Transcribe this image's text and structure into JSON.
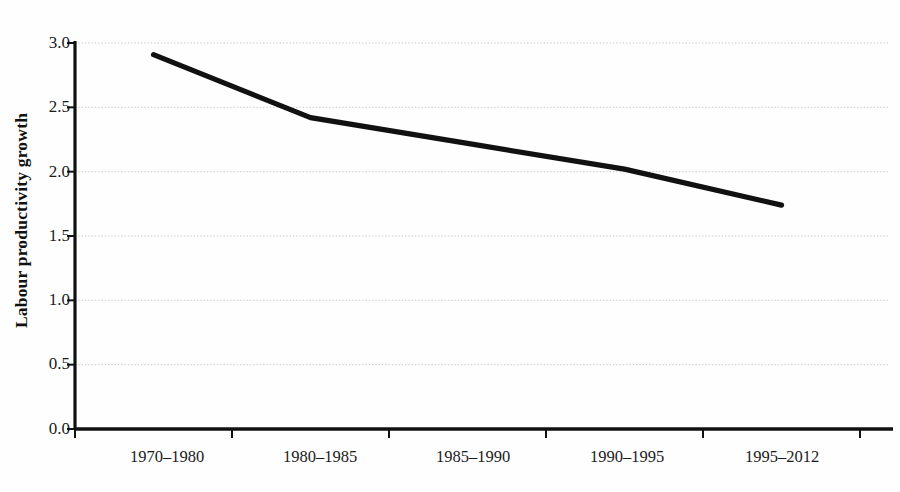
{
  "chart_data": {
    "type": "line",
    "title": "",
    "subtitle": "",
    "xlabel": "",
    "ylabel": "Labour productivity growth",
    "categories": [
      "1970–1980",
      "1980–1985",
      "1985–1990",
      "1990–1995",
      "1995–2012"
    ],
    "values": [
      2.91,
      2.42,
      2.22,
      2.02,
      1.74
    ],
    "series": [
      {
        "name": "Labour productivity growth",
        "values": [
          2.91,
          2.42,
          2.22,
          2.02,
          1.74
        ]
      }
    ],
    "ylim": [
      0.0,
      3.0
    ],
    "yticks": [
      "0.0",
      "0.5",
      "1.0",
      "1.5",
      "2.0",
      "2.5",
      "3.0"
    ],
    "ytick_values": [
      0.0,
      0.5,
      1.0,
      1.5,
      2.0,
      2.5,
      3.0
    ],
    "grid": true,
    "grid_axis": "y",
    "grid_style": "dotted",
    "legend": false,
    "legend_position": "none",
    "line_color": "#111111",
    "grid_color": "#c9c9c9",
    "axis_color": "#111111",
    "background_color": "#fefefe"
  },
  "axes": {
    "y_title": "Labour productivity growth",
    "y_tick_labels": [
      "3.0",
      "2.5",
      "2.0",
      "1.5",
      "1.0",
      "0.5",
      "0.0"
    ],
    "x_tick_labels": [
      "1970–1980",
      "1980–1985",
      "1985–1990",
      "1990–1995",
      "1995–2012"
    ]
  }
}
